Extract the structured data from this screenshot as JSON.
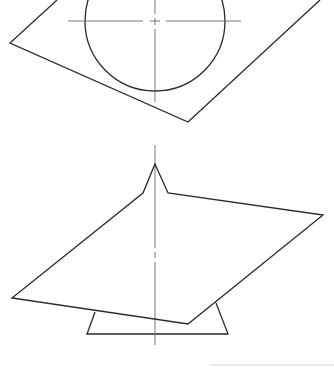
{
  "figure": {
    "colors": {
      "outline": "#2a2a2a",
      "centerline": "#6a6a6a",
      "background": "#ffffff"
    },
    "top_view": {
      "plane_polygon": [
        [
          57,
          0
        ],
        [
          10,
          43
        ],
        [
          188,
          122
        ],
        [
          320,
          0
        ]
      ],
      "circle": {
        "cx": 155,
        "cy": 21,
        "r": 70
      },
      "centerline_horizontal": {
        "y": 21,
        "x1": 68,
        "x2": 241
      },
      "centerline_vertical": {
        "x": 155,
        "y1": 0,
        "y2": 102
      }
    },
    "bottom_view": {
      "sheet_polygon": [
        [
          155,
          164
        ],
        [
          168,
          193
        ],
        [
          323,
          215
        ],
        [
          188,
          324
        ],
        [
          12,
          298
        ],
        [
          143,
          193
        ]
      ],
      "base_trapezoid": [
        [
          95,
          312
        ],
        [
          87,
          334
        ],
        [
          228,
          334
        ],
        [
          216,
          303
        ]
      ],
      "centerline_vertical": {
        "x": 155,
        "y1": 145,
        "y2": 345
      }
    }
  }
}
